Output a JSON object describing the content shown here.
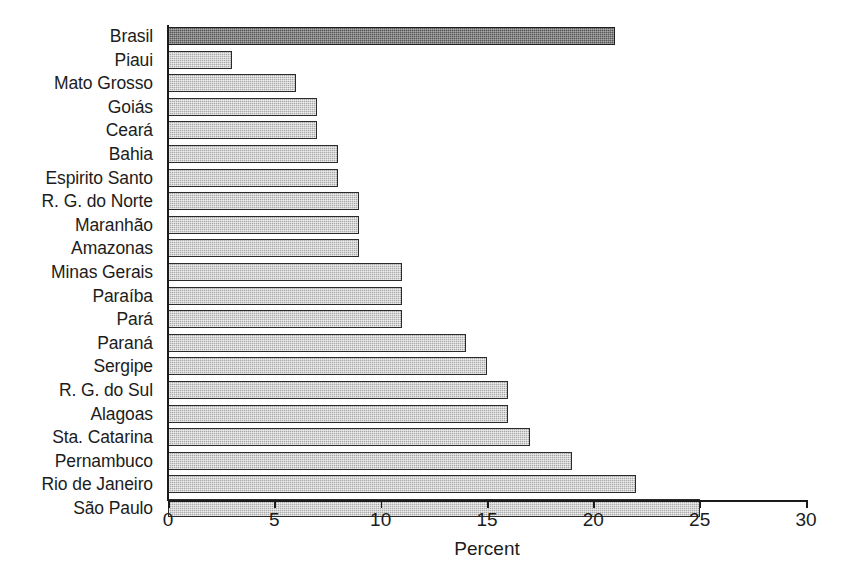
{
  "chart_data": {
    "type": "bar",
    "orientation": "horizontal",
    "title": "",
    "xlabel": "Percent",
    "ylabel": "",
    "xlim": [
      0,
      30
    ],
    "xticks": [
      0,
      5,
      10,
      15,
      20,
      25,
      30
    ],
    "xtick_labels": [
      "0",
      "5",
      "10",
      "15",
      "20",
      "25",
      "30"
    ],
    "grid": false,
    "legend": null,
    "categories": [
      "Brasil",
      "Piaui",
      "Mato Grosso",
      "Goiás",
      "Ceará",
      "Bahia",
      "Espirito Santo",
      "R. G. do Norte",
      "Maranhão",
      "Amazonas",
      "Minas Gerais",
      "Paraíba",
      "Pará",
      "Paraná",
      "Sergipe",
      "R. G. do Sul",
      "Alagoas",
      "Sta. Catarina",
      "Pernambuco",
      "Rio de Janeiro",
      "São Paulo"
    ],
    "values": [
      21,
      3,
      6,
      7,
      7,
      8,
      8,
      9,
      9,
      9,
      11,
      11,
      11,
      14,
      15,
      16,
      16,
      17,
      19,
      22,
      25
    ],
    "highlight_categories": [
      "Brasil"
    ],
    "colors": {
      "bar_fill": "#a9a9a9",
      "bar_fill_highlight": "#565656",
      "bar_outline": "#2b2b2b",
      "axis": "#1a1a1a",
      "text": "#1c1c1c",
      "background": "#ffffff"
    }
  }
}
